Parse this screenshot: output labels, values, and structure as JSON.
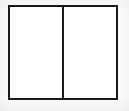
{
  "diagram": {
    "name": "two-panel-frame",
    "background_color": "#fbfaf8",
    "frame": {
      "stroke_color": "#1b1b1b",
      "stroke_width_px": 2,
      "fill_color": "#ffffff",
      "x": 8,
      "y": 5,
      "width": 110,
      "height": 95
    },
    "divider": {
      "orientation": "vertical",
      "stroke_color": "#1b1b1b",
      "stroke_width_px": 2,
      "x": 63
    },
    "panels": [
      {
        "id": "left-panel",
        "label": "",
        "fill_color": "#ffffff",
        "width_px": 53,
        "content": ""
      },
      {
        "id": "right-panel",
        "label": "",
        "fill_color": "#ffffff",
        "width_px": 53,
        "content": ""
      }
    ]
  }
}
